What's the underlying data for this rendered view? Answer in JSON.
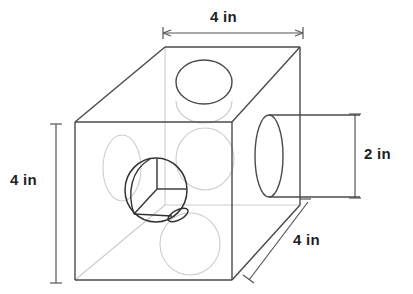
{
  "figure": {
    "units": "in",
    "colors": {
      "solid_line": "#4a4a4a",
      "hidden_line": "#c9c9c9",
      "dimension_line": "#555555",
      "text": "#1f1f1f",
      "background": "#ffffff"
    },
    "dimensions": [
      {
        "id": "top-width",
        "label": "4 in",
        "value": 4,
        "unit": "in",
        "orientation": "horizontal",
        "describes": "cube top edge width",
        "label_x": 210,
        "label_y": 10,
        "line": {
          "x1": 163,
          "y1": 33,
          "x2": 303,
          "y2": 33
        }
      },
      {
        "id": "left-height",
        "label": "4 in",
        "value": 4,
        "unit": "in",
        "orientation": "vertical",
        "describes": "cube front face height",
        "label_x": 10,
        "label_y": 172,
        "line": {
          "x1": 56,
          "y1": 124,
          "x2": 56,
          "y2": 283
        }
      },
      {
        "id": "right-height",
        "label": "2 in",
        "value": 2,
        "unit": "in",
        "orientation": "vertical",
        "describes": "protruding cylinder diameter",
        "label_x": 363,
        "label_y": 146,
        "line": {
          "x1": 355,
          "y1": 114,
          "x2": 355,
          "y2": 198
        }
      },
      {
        "id": "depth",
        "label": "4 in",
        "value": 4,
        "unit": "in",
        "orientation": "diagonal",
        "describes": "cube depth",
        "label_x": 293,
        "label_y": 232,
        "line": {
          "x1": 308,
          "y1": 201,
          "x2": 251,
          "y2": 278
        }
      }
    ],
    "shape": {
      "type": "cube",
      "edge_length": 4,
      "hole_diameter": 2,
      "holes": 3,
      "hole_axes": [
        "vertical",
        "front-to-back",
        "left-to-right"
      ],
      "protrusion": {
        "shape": "cylinder",
        "diameter": 2
      }
    }
  }
}
